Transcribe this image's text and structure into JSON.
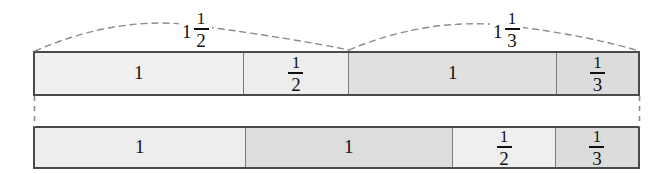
{
  "diagram": {
    "colors": {
      "lightest": "#f2f2f2",
      "light": "#ececec",
      "medium": "#e0e0e0",
      "dark": "#d8d8d8",
      "outline": "#4a4a4a",
      "divider": "#7a7a7a",
      "dashed": "#8c8c8c",
      "ink": "#111111",
      "background": "#ffffff"
    },
    "callouts": [
      {
        "name": "one-and-one-half",
        "whole": "1",
        "numerator": "1",
        "denominator": "2"
      },
      {
        "name": "one-and-one-third",
        "whole": "1",
        "numerator": "1",
        "denominator": "3"
      }
    ],
    "top_bar": {
      "name": "top-bar",
      "segments": [
        {
          "name": "top-segment-one-a",
          "kind": "whole",
          "value": "1",
          "flex": 210,
          "fill": "#f0f0f0"
        },
        {
          "name": "top-segment-one-half",
          "kind": "fraction",
          "numerator": "1",
          "denominator": "2",
          "flex": 106,
          "fill": "#ededed"
        },
        {
          "name": "top-segment-one-b",
          "kind": "whole",
          "value": "1",
          "flex": 209,
          "fill": "#e0e0e0"
        },
        {
          "name": "top-segment-one-third",
          "kind": "fraction",
          "numerator": "1",
          "denominator": "3",
          "flex": 82,
          "fill": "#dcdcdc"
        }
      ]
    },
    "bottom_bar": {
      "name": "bottom-bar",
      "segments": [
        {
          "name": "bottom-segment-one-a",
          "kind": "whole",
          "value": "1",
          "flex": 212,
          "fill": "#ededed"
        },
        {
          "name": "bottom-segment-one-b",
          "kind": "whole",
          "value": "1",
          "flex": 209,
          "fill": "#dddddd"
        },
        {
          "name": "bottom-segment-one-half",
          "kind": "fraction",
          "numerator": "1",
          "denominator": "2",
          "flex": 103,
          "fill": "#efefef"
        },
        {
          "name": "bottom-segment-one-third",
          "kind": "fraction",
          "numerator": "1",
          "denominator": "3",
          "flex": 83,
          "fill": "#dcdcdc"
        }
      ]
    }
  }
}
